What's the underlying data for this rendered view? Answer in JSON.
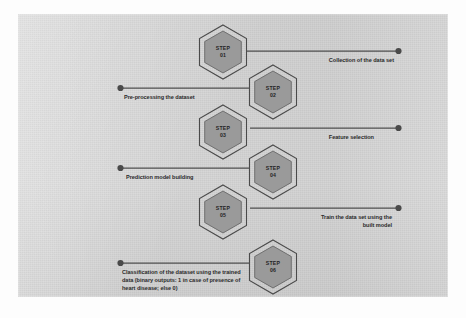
{
  "figure": {
    "panel_color": "#d3d3d3",
    "hexagon_fill": "#9a9a9a",
    "hexagon_stroke": "#4a4a4a",
    "connector_color": "#4e4e4e",
    "text_color": "#2b2b2b"
  },
  "steps": [
    {
      "id": "step-01",
      "badge_label": "STEP",
      "badge_number": "01",
      "side": "right",
      "caption_lines": [
        "Collection of the data set"
      ]
    },
    {
      "id": "step-02",
      "badge_label": "STEP",
      "badge_number": "02",
      "side": "left",
      "caption_lines": [
        "Pre-processing the dataset"
      ]
    },
    {
      "id": "step-03",
      "badge_label": "STEP",
      "badge_number": "03",
      "side": "right",
      "caption_lines": [
        "Feature selection"
      ]
    },
    {
      "id": "step-04",
      "badge_label": "STEP",
      "badge_number": "04",
      "side": "left",
      "caption_lines": [
        "Prediction model building"
      ]
    },
    {
      "id": "step-05",
      "badge_label": "STEP",
      "badge_number": "05",
      "side": "right",
      "caption_lines": [
        "Train the data set using the",
        "built model"
      ]
    },
    {
      "id": "step-06",
      "badge_label": "STEP",
      "badge_number": "06",
      "side": "left",
      "caption_lines": [
        "Classification of the dataset using the trained",
        "data (binary outputs: 1  in case of presence of",
        "heart disease; else 0)"
      ]
    }
  ]
}
